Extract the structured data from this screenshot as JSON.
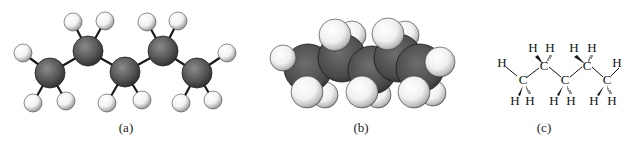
{
  "figure": {
    "panels": [
      {
        "id": "a",
        "label": "(a)",
        "style": "ball-and-stick"
      },
      {
        "id": "b",
        "label": "(b)",
        "style": "space-filling"
      },
      {
        "id": "c",
        "label": "(c)",
        "style": "wedge-dash structural formula"
      }
    ]
  },
  "colors": {
    "carbon": "#5a5a5a",
    "carbon_dark": "#2e2e2e",
    "hydrogen": "#f4f4f4",
    "hydrogen_shade": "#9a9a9a",
    "bond": "#1a1a1a",
    "text": "#222222",
    "background": "#ffffff"
  },
  "structural_formula": {
    "carbon_symbol": "C",
    "hydrogen_symbol": "H",
    "atoms": {
      "C": [
        "C",
        "C",
        "C",
        "C"
      ],
      "H": [
        "H",
        "H",
        "H",
        "H",
        "H",
        "H",
        "H",
        "H",
        "H",
        "H"
      ]
    }
  }
}
